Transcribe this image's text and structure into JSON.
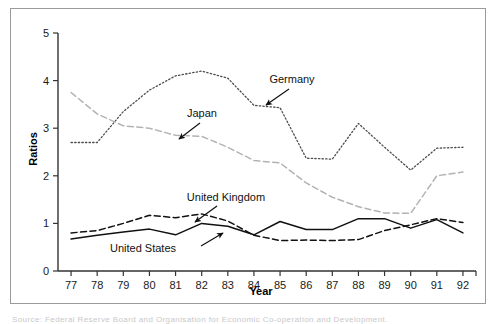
{
  "figure": {
    "caption_sliver": "Source: Federal Reserve Board and Organisation for Economic Co-operation and Development."
  },
  "chart_data": {
    "type": "line",
    "title": "",
    "xlabel": "Year",
    "ylabel": "Ratios",
    "x": [
      77,
      78,
      79,
      80,
      81,
      82,
      83,
      84,
      85,
      86,
      87,
      88,
      89,
      90,
      91,
      92
    ],
    "categories": [
      "77",
      "78",
      "79",
      "80",
      "81",
      "82",
      "83",
      "84",
      "85",
      "86",
      "87",
      "88",
      "89",
      "90",
      "91",
      "92"
    ],
    "xlim": [
      76.5,
      92.5
    ],
    "ylim": [
      0,
      5
    ],
    "ytick_labels": [
      "0",
      "1",
      "2",
      "3",
      "4",
      "5"
    ],
    "yticks": [
      0,
      1,
      2,
      3,
      4,
      5
    ],
    "grid": false,
    "legend": "inline-annotations",
    "series": [
      {
        "name": "Germany",
        "style": "dotted",
        "color": "#4d4d4d",
        "values": [
          2.7,
          2.7,
          3.35,
          3.8,
          4.1,
          4.2,
          4.05,
          3.48,
          3.43,
          2.37,
          2.35,
          3.1,
          2.6,
          2.12,
          2.58,
          2.6
        ]
      },
      {
        "name": "Japan",
        "style": "dashed",
        "color": "#b3b3b3",
        "values": [
          3.75,
          3.3,
          3.05,
          3.0,
          2.85,
          2.83,
          2.6,
          2.32,
          2.27,
          1.85,
          1.55,
          1.35,
          1.22,
          1.21,
          2.0,
          2.08
        ]
      },
      {
        "name": "United Kingdom",
        "style": "dashed",
        "color": "#111111",
        "values": [
          0.8,
          0.85,
          1.0,
          1.17,
          1.12,
          1.2,
          1.05,
          0.75,
          0.64,
          0.65,
          0.64,
          0.66,
          0.85,
          0.97,
          1.1,
          1.02
        ]
      },
      {
        "name": "United States",
        "style": "solid",
        "color": "#111111",
        "values": [
          0.67,
          0.75,
          0.82,
          0.88,
          0.76,
          1.0,
          0.94,
          0.76,
          1.04,
          0.87,
          0.87,
          1.1,
          1.1,
          0.9,
          1.08,
          0.8
        ]
      }
    ],
    "annotations": [
      {
        "label": "Germany",
        "text_x": 281,
        "text_y": 74,
        "arrow_from_x": 278,
        "arrow_from_y": 80,
        "arrow_to_x": 255,
        "arrow_to_y": 96
      },
      {
        "label": "Japan",
        "text_x": 191,
        "text_y": 108,
        "arrow_from_x": 189,
        "arrow_from_y": 114,
        "arrow_to_x": 168,
        "arrow_to_y": 130
      },
      {
        "label": "United Kingdom",
        "text_x": 215,
        "text_y": 192,
        "arrow_from_x": 206,
        "arrow_from_y": 197,
        "arrow_to_x": 184,
        "arrow_to_y": 213
      },
      {
        "label": "United States",
        "text_x": 132,
        "text_y": 243,
        "arrow_from_x": 190,
        "arrow_from_y": 237,
        "arrow_to_x": 212,
        "arrow_to_y": 224
      }
    ]
  }
}
